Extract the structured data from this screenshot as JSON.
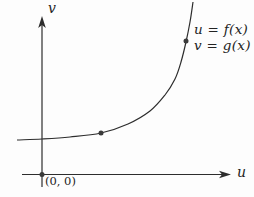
{
  "figure": {
    "background": "#fdfdfd",
    "line_color": "#2d2d2d",
    "dot_color": "#3a3a3a",
    "labels": {
      "v_axis": "v",
      "u_axis": "u",
      "origin": "(0, 0)",
      "equation_line1": "u = f(x)",
      "equation_line2": "v = g(x)"
    },
    "axes": {
      "v": {
        "x": 42,
        "y_tip": 16,
        "y_bottom": 187
      },
      "u": {
        "y": 174.5,
        "x_left": 22,
        "x_tip": 231
      }
    },
    "origin_dot": {
      "x": 42,
      "y": 174.5,
      "r": 2.5
    },
    "curve": {
      "points": [
        [
          17,
          140
        ],
        [
          42,
          139
        ],
        [
          70,
          137
        ],
        [
          101,
          133
        ],
        [
          128,
          124
        ],
        [
          150,
          111
        ],
        [
          165,
          95
        ],
        [
          175,
          79
        ],
        [
          181,
          62
        ],
        [
          186,
          42
        ],
        [
          190,
          22
        ],
        [
          193,
          2
        ]
      ]
    },
    "curve_dots": [
      {
        "x": 101,
        "y": 133,
        "r": 2.5
      },
      {
        "x": 186,
        "y": 41,
        "r": 2.5
      }
    ]
  }
}
